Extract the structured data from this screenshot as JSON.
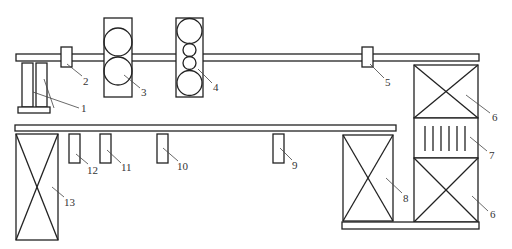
{
  "diagram": {
    "caption_fragment": "",
    "line_color": "#222222",
    "leader_color": "#444444",
    "label_color": "#333333",
    "components": [
      {
        "id": "1",
        "label": "1",
        "shape": "twin-posts-on-base"
      },
      {
        "id": "2",
        "label": "2",
        "shape": "small-box-on-upper-rail"
      },
      {
        "id": "3",
        "label": "3",
        "shape": "box-with-two-rollers"
      },
      {
        "id": "4",
        "label": "4",
        "shape": "box-with-four-rollers"
      },
      {
        "id": "5",
        "label": "5",
        "shape": "small-box-on-upper-rail"
      },
      {
        "id": "6a",
        "label": "6",
        "shape": "crossed-box-upper"
      },
      {
        "id": "7",
        "label": "7",
        "shape": "box-with-vertical-bars"
      },
      {
        "id": "6b",
        "label": "6",
        "shape": "crossed-box-lower"
      },
      {
        "id": "8",
        "label": "8",
        "shape": "crossed-box"
      },
      {
        "id": "9",
        "label": "9",
        "shape": "small-box-under-middle-rail"
      },
      {
        "id": "10",
        "label": "10",
        "shape": "small-box-under-middle-rail"
      },
      {
        "id": "11",
        "label": "11",
        "shape": "small-box-under-middle-rail"
      },
      {
        "id": "12",
        "label": "12",
        "shape": "small-box-under-middle-rail"
      },
      {
        "id": "13",
        "label": "13",
        "shape": "crossed-box"
      }
    ],
    "rails": [
      {
        "name": "upper-rail"
      },
      {
        "name": "middle-rail"
      },
      {
        "name": "bottom-rail"
      }
    ]
  }
}
